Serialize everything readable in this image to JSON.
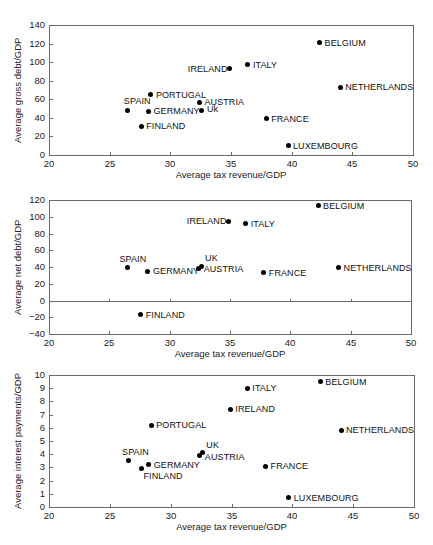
{
  "chart_data": [
    {
      "type": "scatter",
      "title": "",
      "xlabel": "Average tax revenue/GDP",
      "ylabel": "Average gross debt/GDP",
      "xlim": [
        20,
        50
      ],
      "ylim": [
        0,
        140
      ],
      "xticks": [
        "20",
        "25",
        "30",
        "35",
        "40",
        "45",
        "50"
      ],
      "yticks": [
        "0",
        "20",
        "40",
        "60",
        "80",
        "100",
        "120",
        "140"
      ],
      "grid": false,
      "points": [
        {
          "label": "BELGIUM",
          "x": 42.3,
          "y": 121,
          "lx": 5,
          "ly": -5
        },
        {
          "label": "ITALY",
          "x": 36.4,
          "y": 97,
          "lx": 5,
          "ly": -5
        },
        {
          "label": "IRELAND",
          "x": 34.9,
          "y": 93,
          "lx": -42,
          "ly": -5
        },
        {
          "label": "NETHERLANDS",
          "x": 44.0,
          "y": 73,
          "lx": 5,
          "ly": -5
        },
        {
          "label": "PORTUGAL",
          "x": 28.4,
          "y": 65,
          "lx": 5,
          "ly": -5
        },
        {
          "label": "AUSTRIA",
          "x": 32.4,
          "y": 57,
          "lx": 5,
          "ly": -5
        },
        {
          "label": "SPAIN",
          "x": 26.5,
          "y": 48,
          "lx": -4,
          "ly": -14
        },
        {
          "label": "GERMANY",
          "x": 28.2,
          "y": 47,
          "lx": 5,
          "ly": -5
        },
        {
          "label": "Uk",
          "x": 32.6,
          "y": 48,
          "lx": 5,
          "ly": -6
        },
        {
          "label": "FRANCE",
          "x": 37.9,
          "y": 39,
          "lx": 5,
          "ly": -5
        },
        {
          "label": "FINLAND",
          "x": 27.6,
          "y": 31,
          "lx": 5,
          "ly": -5
        },
        {
          "label": "LUXEMBOURG",
          "x": 39.7,
          "y": 10,
          "lx": 5,
          "ly": -5
        }
      ]
    },
    {
      "type": "scatter",
      "title": "",
      "xlabel": "Average tax revenue/GDP",
      "ylabel": "Average net debt/GDP",
      "xlim": [
        20,
        50
      ],
      "ylim": [
        -40,
        120
      ],
      "xticks": [
        "20",
        "25",
        "30",
        "35",
        "40",
        "45",
        "50"
      ],
      "yticks": [
        "−40",
        "−20",
        "0",
        "20",
        "40",
        "60",
        "80",
        "100",
        "120"
      ],
      "grid": false,
      "zero_line": true,
      "points": [
        {
          "label": "BELGIUM",
          "x": 42.3,
          "y": 113,
          "lx": 5,
          "ly": -5
        },
        {
          "label": "IRELAND",
          "x": 34.9,
          "y": 94,
          "lx": -42,
          "ly": -6
        },
        {
          "label": "ITALY",
          "x": 36.3,
          "y": 92,
          "lx": 5,
          "ly": -4
        },
        {
          "label": "SPAIN",
          "x": 26.5,
          "y": 39,
          "lx": -8,
          "ly": -14
        },
        {
          "label": "UK",
          "x": 32.6,
          "y": 41,
          "lx": 4,
          "ly": -13
        },
        {
          "label": "AUSTRIA",
          "x": 32.4,
          "y": 38,
          "lx": 5,
          "ly": -5
        },
        {
          "label": "NETHERLANDS",
          "x": 44.0,
          "y": 39,
          "lx": 5,
          "ly": -5
        },
        {
          "label": "GERMANY",
          "x": 28.2,
          "y": 35,
          "lx": 5,
          "ly": -5
        },
        {
          "label": "FRANCE",
          "x": 37.8,
          "y": 33,
          "lx": 5,
          "ly": -5
        },
        {
          "label": "FINLAND",
          "x": 27.6,
          "y": -17,
          "lx": 5,
          "ly": -5
        }
      ]
    },
    {
      "type": "scatter",
      "title": "",
      "xlabel": "Average tax revenue/GDP",
      "ylabel": "Average interest payments/GDP",
      "xlim": [
        20,
        50
      ],
      "ylim": [
        0,
        10
      ],
      "xticks": [
        "20",
        "25",
        "30",
        "35",
        "40",
        "45",
        "50"
      ],
      "yticks": [
        "0",
        "1",
        "2",
        "3",
        "4",
        "5",
        "6",
        "7",
        "8",
        "9",
        "10"
      ],
      "grid": false,
      "points": [
        {
          "label": "BELGIUM",
          "x": 42.3,
          "y": 9.5,
          "lx": 5,
          "ly": -5
        },
        {
          "label": "ITALY",
          "x": 36.3,
          "y": 9.0,
          "lx": 5,
          "ly": -5
        },
        {
          "label": "IRELAND",
          "x": 34.9,
          "y": 7.4,
          "lx": 5,
          "ly": -5
        },
        {
          "label": "PORTUGAL",
          "x": 28.4,
          "y": 6.2,
          "lx": 5,
          "ly": -5
        },
        {
          "label": "NETHERLANDS",
          "x": 44.0,
          "y": 5.8,
          "lx": 5,
          "ly": -5
        },
        {
          "label": "UK",
          "x": 32.6,
          "y": 4.1,
          "lx": 4,
          "ly": -13
        },
        {
          "label": "AUSTRIA",
          "x": 32.4,
          "y": 3.9,
          "lx": 5,
          "ly": -4
        },
        {
          "label": "SPAIN",
          "x": 26.5,
          "y": 3.5,
          "lx": -6,
          "ly": -14
        },
        {
          "label": "GERMANY",
          "x": 28.2,
          "y": 3.2,
          "lx": 5,
          "ly": -5
        },
        {
          "label": "FRANCE",
          "x": 37.8,
          "y": 3.1,
          "lx": 5,
          "ly": -5
        },
        {
          "label": "FINLAND",
          "x": 27.6,
          "y": 2.9,
          "lx": 2,
          "ly": 2
        },
        {
          "label": "LUXEMBOURG",
          "x": 39.7,
          "y": 0.7,
          "lx": 5,
          "ly": -5
        }
      ]
    }
  ],
  "layout": [
    {
      "left": 49,
      "right": 413,
      "top": 25,
      "bottom": 155,
      "xlabel_y": 169
    },
    {
      "left": 49,
      "right": 411,
      "top": 200,
      "bottom": 334,
      "xlabel_y": 348
    },
    {
      "left": 49,
      "right": 414,
      "top": 375,
      "bottom": 507,
      "xlabel_y": 521
    }
  ]
}
